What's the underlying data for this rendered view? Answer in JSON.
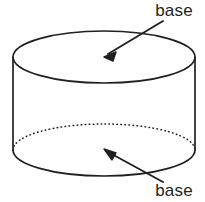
{
  "figure": {
    "name": "cylinder-diagram",
    "background_color": "#ffffff",
    "stroke_color": "#231f20",
    "shape": "cylinder",
    "labels": {
      "top": "base",
      "bottom": "base"
    },
    "annotations": [
      {
        "id": "top-base-annotation",
        "label": "base",
        "label_x": 174,
        "label_y": 16,
        "arrow_tail_x": 163,
        "arrow_tail_y": 21,
        "arrow_tip_x": 104,
        "arrow_tip_y": 57,
        "points_to": "top-base"
      },
      {
        "id": "bottom-base-annotation",
        "label": "base",
        "label_x": 174,
        "label_y": 195,
        "arrow_tail_x": 163,
        "arrow_tail_y": 182,
        "arrow_tip_x": 104,
        "arrow_tip_y": 149,
        "points_to": "bottom-base"
      }
    ],
    "geometry": {
      "left_x": 13,
      "right_x": 195,
      "top_ellipse_center_y": 57,
      "bottom_ellipse_center_y": 150,
      "ellipse_rx": 91,
      "ellipse_ry": 26,
      "top_base_edge": "solid",
      "bottom_front_edge": "solid",
      "bottom_back_edge": "dotted"
    }
  }
}
